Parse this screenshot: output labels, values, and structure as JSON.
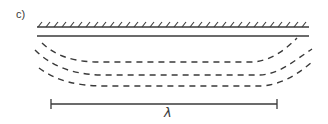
{
  "figure": {
    "panel_label": "c)",
    "scale_label": "λ",
    "colors": {
      "ink": "#3a3a3a",
      "background": "#ffffff"
    },
    "elements": {
      "surface_hatched_line": "fixed boundary (hatched)",
      "solid_line": "interface line",
      "dashed_curves": 3,
      "scale_bar": "wavelength scale bar"
    }
  }
}
